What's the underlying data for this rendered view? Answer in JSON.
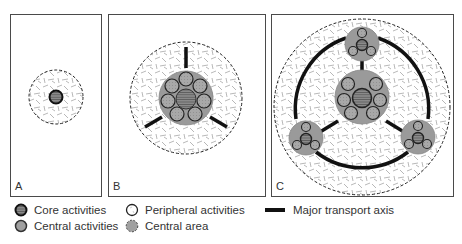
{
  "panels": [
    {
      "id": "A",
      "label": "A"
    },
    {
      "id": "B",
      "label": "B"
    },
    {
      "id": "C",
      "label": "C"
    }
  ],
  "legend": {
    "core_activities": "Core activities",
    "central_activities": "Central activities",
    "peripheral_activities": "Peripheral activities",
    "central_area": "Central area",
    "major_transport_axis": "Major transport axis"
  },
  "colors": {
    "panel_border": "#4a4a4a",
    "central_fill": "#9a9a9a",
    "activity_fill": "#a8a8a8",
    "core_fill": "#777777",
    "outline": "#222222",
    "transport": "#111111",
    "hatch": "#9a9a9a"
  }
}
